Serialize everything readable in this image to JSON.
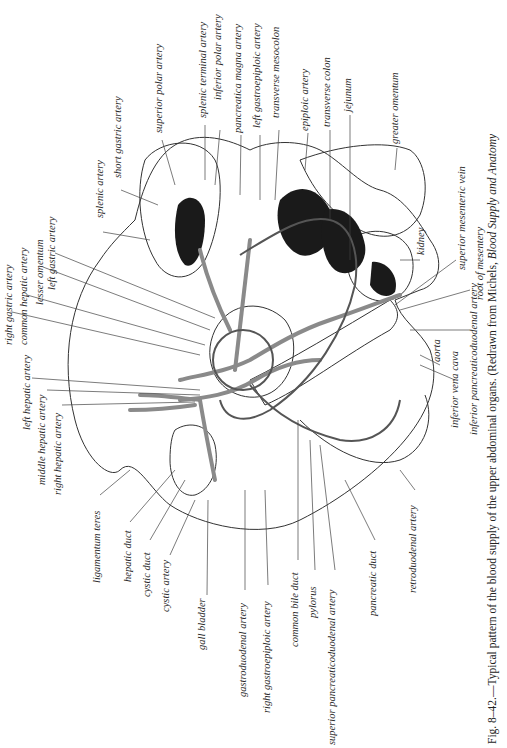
{
  "figure": {
    "number": "Fig. 8–42.",
    "caption_text": "—Typical pattern of the blood supply of the upper abdominal organs. (Redrawn from Michels, ",
    "caption_italic": "Blood Supply and Anatomy",
    "orientation": "rotated 90° counter-clockwise",
    "labels": [
      {
        "id": "right-gastric-artery",
        "text": "right gastric artery",
        "x": 4,
        "y": 345
      },
      {
        "id": "common-hepatic-artery",
        "text": "common hepatic artery",
        "x": 19,
        "y": 345
      },
      {
        "id": "lesser-omentum",
        "text": "lesser omentum",
        "x": 35,
        "y": 305
      },
      {
        "id": "left-gastric-artery",
        "text": "left gastric artery",
        "x": 47,
        "y": 290
      },
      {
        "id": "left-hepatic-artery",
        "text": "left hepatic artery",
        "x": 22,
        "y": 430
      },
      {
        "id": "middle-hepatic-artery",
        "text": "middle hepatic artery",
        "x": 37,
        "y": 485
      },
      {
        "id": "right-hepatic-artery",
        "text": "right hepatic artery",
        "x": 53,
        "y": 495
      },
      {
        "id": "ligamentum-teres",
        "text": "ligamentum teres",
        "x": 92,
        "y": 583
      },
      {
        "id": "hepatic-duct",
        "text": "hepatic duct",
        "x": 123,
        "y": 582
      },
      {
        "id": "cystic-duct",
        "text": "cystic duct",
        "x": 142,
        "y": 597
      },
      {
        "id": "cystic-artery",
        "text": "cystic artery",
        "x": 161,
        "y": 612
      },
      {
        "id": "gall-bladder",
        "text": "gall bladder",
        "x": 197,
        "y": 650
      },
      {
        "id": "gastroduodenal-artery",
        "text": "gastroduodenal artery",
        "x": 238,
        "y": 697
      },
      {
        "id": "right-gastroepiploic-artery",
        "text": "right gastroepiploic artery",
        "x": 262,
        "y": 713
      },
      {
        "id": "common-bile-duct",
        "text": "common bile duct",
        "x": 290,
        "y": 647
      },
      {
        "id": "pylorus",
        "text": "pylorus",
        "x": 308,
        "y": 618
      },
      {
        "id": "superior-pancreaticoduodenal-artery",
        "text": "superior pancreaticoduodenal artery",
        "x": 327,
        "y": 745
      },
      {
        "id": "pancreatic-duct",
        "text": "pancreatic duct",
        "x": 368,
        "y": 616
      },
      {
        "id": "retroduodenal-artery",
        "text": "retroduodenal artery",
        "x": 408,
        "y": 593
      },
      {
        "id": "splenic-artery",
        "text": "splenic artery",
        "x": 95,
        "y": 218
      },
      {
        "id": "short-gastric-artery",
        "text": "short gastric artery",
        "x": 113,
        "y": 178
      },
      {
        "id": "superior-polar-artery",
        "text": "superior polar artery",
        "x": 154,
        "y": 133
      },
      {
        "id": "splenic-terminal-artery",
        "text": "splenic terminal artery",
        "x": 198,
        "y": 118
      },
      {
        "id": "inferior-polar-artery",
        "text": "inferior polar artery",
        "x": 213,
        "y": 100
      },
      {
        "id": "pancreatica-magna-artery",
        "text": "pancreatica magna artery",
        "x": 233,
        "y": 133
      },
      {
        "id": "left-gastroepiploic-artery",
        "text": "left gastroepiploic artery",
        "x": 252,
        "y": 128
      },
      {
        "id": "transverse-mesocolon",
        "text": "transverse mesocolon",
        "x": 271,
        "y": 118
      },
      {
        "id": "epiploic-artery",
        "text": "epiploic artery",
        "x": 300,
        "y": 131
      },
      {
        "id": "transverse-colon",
        "text": "transverse colon",
        "x": 322,
        "y": 127
      },
      {
        "id": "jejunum",
        "text": "jejunum",
        "x": 343,
        "y": 112
      },
      {
        "id": "greater-omentum",
        "text": "greater omentum",
        "x": 390,
        "y": 144
      },
      {
        "id": "kidney",
        "text": "kidney",
        "x": 416,
        "y": 255
      },
      {
        "id": "superior-mesenteric-vein",
        "text": "superior mesenteric vein",
        "x": 457,
        "y": 270
      },
      {
        "id": "root-of-mesentery",
        "text": "root of mesentery",
        "x": 475,
        "y": 300
      },
      {
        "id": "aorta",
        "text": "aorta",
        "x": 432,
        "y": 362
      },
      {
        "id": "inferior-vena-cava",
        "text": "inferior vena cava",
        "x": 450,
        "y": 428
      },
      {
        "id": "inferior-pancreaticoduodenal-artery",
        "text": "inferior pancreaticoduodenal artery",
        "x": 469,
        "y": 435
      }
    ]
  }
}
